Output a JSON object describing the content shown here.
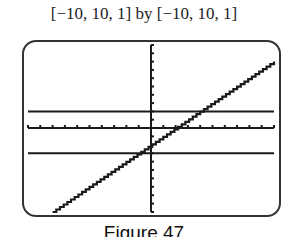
{
  "window_label": "[−10, 10, 1] by [−10, 10, 1]",
  "caption": "Figure 47",
  "colors": {
    "ink": "#1a1a1a",
    "frame": "#333333",
    "background": "#ffffff"
  },
  "chart_data": {
    "type": "line",
    "title": "[−10, 10, 1] by [−10, 10, 1]",
    "caption": "Figure 47",
    "xlabel": "",
    "ylabel": "",
    "xlim": [
      -10,
      10
    ],
    "ylim": [
      -10,
      10
    ],
    "xscale": 1,
    "yscale": 1,
    "grid": false,
    "axes_ticks": true,
    "series": [
      {
        "name": "y = x - 2",
        "style": "pixelated",
        "x": [
          -8,
          10
        ],
        "y": [
          -10,
          8
        ]
      },
      {
        "name": "y = 2",
        "style": "solid",
        "x": [
          -10,
          10
        ],
        "y": [
          2,
          2
        ]
      },
      {
        "name": "y = -3",
        "style": "solid",
        "x": [
          -10,
          10
        ],
        "y": [
          -3,
          -3
        ]
      }
    ],
    "intersections": [
      {
        "x": 4,
        "y": 2
      },
      {
        "x": -1,
        "y": -3
      }
    ]
  }
}
